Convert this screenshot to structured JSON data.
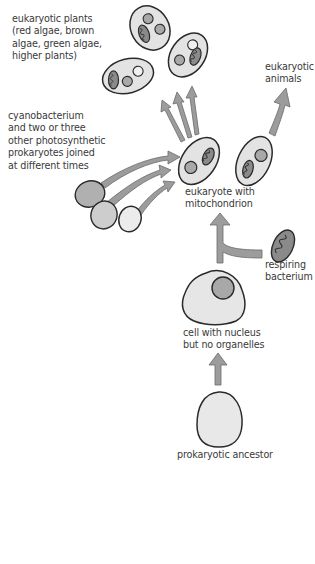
{
  "labels": {
    "plants": [
      "eukaryotic plants",
      "(red algae, brown",
      "algae, green algae,",
      "higher plants)"
    ],
    "animals": [
      "eukaryotic",
      "animals"
    ],
    "cyano": [
      "cyanobacterium",
      "and two or three",
      "other photosynthetic",
      "prokaryotes joined",
      "at different times"
    ],
    "eukaryote": [
      "eukaryote with",
      "mitochondrion"
    ],
    "respiring": [
      "respiring",
      "bacterium"
    ],
    "nucleus_cell": [
      "cell with nucleus",
      "but no organelles"
    ],
    "ancestor": [
      "prokaryotic ancestor"
    ]
  },
  "colors": {
    "cell_fill": "#e3e3e3",
    "outline": "#2a2a2a",
    "arrow_fill": "#9c9c9c",
    "organelle_dark": "#a8a8a8",
    "organelle_light": "#f0f0f0",
    "text": "#3a3a3a"
  }
}
